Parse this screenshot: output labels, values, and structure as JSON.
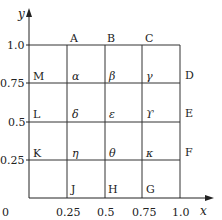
{
  "axes": {
    "x_label": "x",
    "y_label": "y",
    "origin_label": "0",
    "x_ticks": [
      "0.25",
      "0.5",
      "0.75",
      "1.0"
    ],
    "y_ticks": [
      "1.0",
      "0.75",
      "0.5",
      "0.25"
    ]
  },
  "boundary_labels": {
    "top": [
      "A",
      "B",
      "C"
    ],
    "right": [
      "D",
      "E",
      "F"
    ],
    "bottom": [
      "J",
      "H",
      "G"
    ],
    "left": [
      "M",
      "L",
      "K"
    ]
  },
  "interior_labels": {
    "row_075": [
      "α",
      "β",
      "γ"
    ],
    "row_050": [
      "δ",
      "ε",
      "ϒ"
    ],
    "row_025": [
      "η",
      "θ",
      "κ"
    ]
  },
  "grid": {
    "divisions": 4,
    "line_color": "#333333"
  }
}
